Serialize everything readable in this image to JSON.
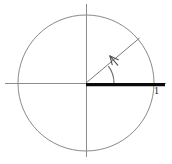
{
  "figure": {
    "background_color": "#ffffff",
    "width": 172,
    "height": 164
  },
  "labels": {
    "unit_label": "1"
  },
  "icons": {
    "arrowhead": "arrow-head-icon"
  },
  "colors": {
    "axis": "#8c8c8c",
    "circle": "#8a8a8a",
    "radius": "#7a7a7a",
    "arc": "#6e6e6e",
    "bold_segment": "#0b0b0b",
    "label": "#1a1a1a"
  },
  "chart_data": {
    "type": "scatter",
    "title": "",
    "subtitle": "",
    "xlabel": "",
    "ylabel": "",
    "grid": false,
    "legend": "none",
    "xlim": [
      -1.25,
      1.25
    ],
    "ylim": [
      -1.2,
      1.2
    ],
    "geometry": {
      "center": [
        86,
        83
      ],
      "radius_px": 68,
      "circle": {
        "cx": 86,
        "cy": 83,
        "r": 68,
        "description": "unit circle"
      },
      "horizontal_axis": {
        "x1": 5,
        "y1": 83,
        "x2": 166,
        "y2": 83
      },
      "vertical_axis": {
        "x1": 86,
        "y1": 4,
        "x2": 86,
        "y2": 157
      },
      "radius_line": {
        "from": [
          86,
          83
        ],
        "to": [
          137,
          41
        ],
        "angle_degrees": 40
      },
      "angle_arc": {
        "cx": 86,
        "cy": 83,
        "r": 28,
        "start_angle_degrees": 0,
        "end_angle_degrees": 40,
        "direction": "counterclockwise",
        "arrow_at": "end"
      },
      "arrow_head": {
        "tip": [
          110,
          56
        ],
        "direction_degrees": 130
      },
      "bold_segment": {
        "from": [
          86,
          84
        ],
        "to": [
          165,
          84
        ],
        "label": "1",
        "label_position": [
          154,
          86
        ],
        "thickness_px": 3
      }
    },
    "annotations": [
      {
        "text": "1",
        "x": 154,
        "y": 86,
        "describes": "length of the bold radius segment along the positive x-axis"
      }
    ]
  }
}
